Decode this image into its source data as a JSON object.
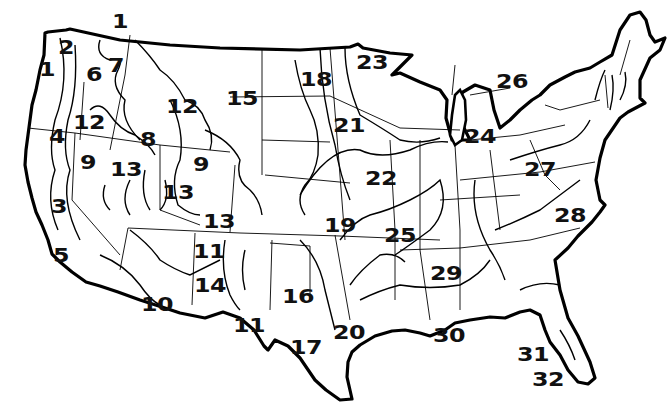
{
  "map": {
    "subject": "Contiguous United States regions",
    "colors": {
      "ink": "#000000",
      "background": "#ffffff"
    },
    "regions": [
      {
        "id": "1",
        "x": 112,
        "y": 12
      },
      {
        "id": "2",
        "x": 58,
        "y": 38
      },
      {
        "id": "1",
        "x": 39,
        "y": 60
      },
      {
        "id": "6",
        "x": 86,
        "y": 65
      },
      {
        "id": "7",
        "x": 108,
        "y": 56
      },
      {
        "id": "12",
        "x": 166,
        "y": 97
      },
      {
        "id": "15",
        "x": 226,
        "y": 89
      },
      {
        "id": "18",
        "x": 300,
        "y": 70
      },
      {
        "id": "23",
        "x": 356,
        "y": 53
      },
      {
        "id": "26",
        "x": 496,
        "y": 72
      },
      {
        "id": "4",
        "x": 49,
        "y": 127
      },
      {
        "id": "12",
        "x": 73,
        "y": 113
      },
      {
        "id": "8",
        "x": 140,
        "y": 130
      },
      {
        "id": "21",
        "x": 333,
        "y": 116
      },
      {
        "id": "24",
        "x": 464,
        "y": 127
      },
      {
        "id": "9",
        "x": 80,
        "y": 153
      },
      {
        "id": "13",
        "x": 110,
        "y": 160
      },
      {
        "id": "9",
        "x": 193,
        "y": 155
      },
      {
        "id": "22",
        "x": 365,
        "y": 169
      },
      {
        "id": "27",
        "x": 524,
        "y": 160
      },
      {
        "id": "3",
        "x": 51,
        "y": 197
      },
      {
        "id": "13",
        "x": 162,
        "y": 183
      },
      {
        "id": "13",
        "x": 203,
        "y": 212
      },
      {
        "id": "19",
        "x": 324,
        "y": 216
      },
      {
        "id": "25",
        "x": 384,
        "y": 226
      },
      {
        "id": "28",
        "x": 554,
        "y": 206
      },
      {
        "id": "5",
        "x": 53,
        "y": 246
      },
      {
        "id": "11",
        "x": 193,
        "y": 242
      },
      {
        "id": "14",
        "x": 194,
        "y": 276
      },
      {
        "id": "29",
        "x": 430,
        "y": 264
      },
      {
        "id": "16",
        "x": 282,
        "y": 287
      },
      {
        "id": "10",
        "x": 141,
        "y": 295
      },
      {
        "id": "11",
        "x": 233,
        "y": 316
      },
      {
        "id": "20",
        "x": 333,
        "y": 323
      },
      {
        "id": "17",
        "x": 290,
        "y": 338
      },
      {
        "id": "30",
        "x": 433,
        "y": 326
      },
      {
        "id": "31",
        "x": 517,
        "y": 345
      },
      {
        "id": "32",
        "x": 532,
        "y": 370
      }
    ]
  }
}
